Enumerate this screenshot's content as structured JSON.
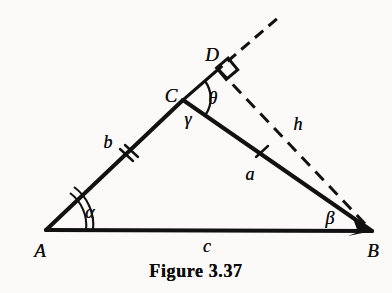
{
  "figure": {
    "caption": "Figure 3.37",
    "caption_position": {
      "x": 196,
      "y": 271
    },
    "background_color": "#fbfaf8",
    "ink_color": "#111111",
    "canvas": {
      "width": 392,
      "height": 293
    }
  },
  "vertices": [
    {
      "id": "A",
      "label": "A",
      "x": 46,
      "y": 230,
      "label_x": 40,
      "label_y": 250
    },
    {
      "id": "B",
      "label": "B",
      "x": 372,
      "y": 231,
      "label_x": 373,
      "label_y": 250
    },
    {
      "id": "C",
      "label": "C",
      "x": 183,
      "y": 100,
      "label_x": 171,
      "label_y": 95
    },
    {
      "id": "D",
      "label": "D",
      "x": 218,
      "y": 68,
      "label_x": 212,
      "label_y": 54
    }
  ],
  "sides": [
    {
      "id": "b",
      "label": "b",
      "from": "A",
      "to": "C",
      "label_x": 108,
      "label_y": 142,
      "ticks": 2,
      "tick_x": 128,
      "tick_y": 156
    },
    {
      "id": "a",
      "label": "a",
      "from": "C",
      "to": "B",
      "label_x": 250,
      "label_y": 174,
      "ticks": 1,
      "tick_x": 262,
      "tick_y": 152
    },
    {
      "id": "c",
      "label": "c",
      "from": "A",
      "to": "B",
      "label_x": 207,
      "label_y": 246,
      "ticks": 0
    },
    {
      "id": "h",
      "label": "h",
      "from": "D",
      "to": "B",
      "label_x": 298,
      "label_y": 124,
      "ticks": 0,
      "style": "dashed"
    }
  ],
  "angles": [
    {
      "id": "alpha",
      "label": "α",
      "at": "A",
      "label_x": 90,
      "label_y": 212,
      "arcs": 2,
      "marker": "arc"
    },
    {
      "id": "beta",
      "label": "β",
      "at": "B",
      "label_x": 330,
      "label_y": 218,
      "arcs": 0,
      "marker": "none"
    },
    {
      "id": "gamma",
      "label": "γ",
      "at": "C",
      "label_x": 188,
      "label_y": 119,
      "arcs": 0,
      "marker": "none"
    },
    {
      "id": "theta",
      "label": "θ",
      "at": "C",
      "label_x": 213,
      "label_y": 98,
      "arcs": 1,
      "marker": "arc"
    },
    {
      "id": "right_angle_at_D",
      "label": "",
      "at": "D",
      "label_x": 0,
      "label_y": 0,
      "arcs": 0,
      "marker": "square"
    }
  ],
  "construction_lines": [
    {
      "id": "CD-extension",
      "from": {
        "x": 183,
        "y": 100
      },
      "to": {
        "x": 279,
        "y": 17
      },
      "style": "dashed",
      "note": "extension of side CA beyond C through D"
    }
  ]
}
